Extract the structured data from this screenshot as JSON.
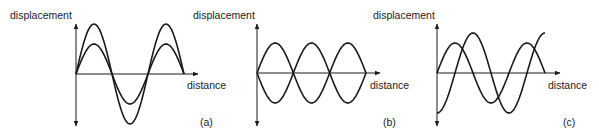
{
  "figure": {
    "panels": [
      {
        "id": "a",
        "tag": "(a)",
        "y_label": "displacement",
        "x_label": "distance",
        "description": "Two in-phase waves of equal wavelength and different amplitude",
        "waves": [
          {
            "name": "large-amplitude",
            "amplitude": 50,
            "wavelengths": 1.5,
            "phase": "sine"
          },
          {
            "name": "small-amplitude",
            "amplitude": 30,
            "wavelengths": 1.5,
            "phase": "sine"
          }
        ]
      },
      {
        "id": "b",
        "tag": "(b)",
        "y_label": "displacement",
        "x_label": "distance",
        "description": "Two waves of equal amplitude in antiphase",
        "waves": [
          {
            "name": "wave-up",
            "amplitude": 30,
            "wavelengths": 1.5,
            "phase": "sine"
          },
          {
            "name": "wave-down",
            "amplitude": 30,
            "wavelengths": 1.5,
            "phase": "inverted-sine"
          }
        ]
      },
      {
        "id": "c",
        "tag": "(c)",
        "y_label": "displacement",
        "x_label": "distance",
        "description": "Two waves with different amplitude and a phase difference",
        "waves": [
          {
            "name": "smaller-sine",
            "amplitude": 30,
            "wavelengths": 1.5,
            "phase": "sine"
          },
          {
            "name": "larger-shifted",
            "amplitude": 40,
            "wavelengths": 1.5,
            "phase": "negative-cosine"
          }
        ]
      }
    ],
    "colors": {
      "line": "#1a1a1a",
      "text": "#222222",
      "background": "#ffffff"
    }
  }
}
